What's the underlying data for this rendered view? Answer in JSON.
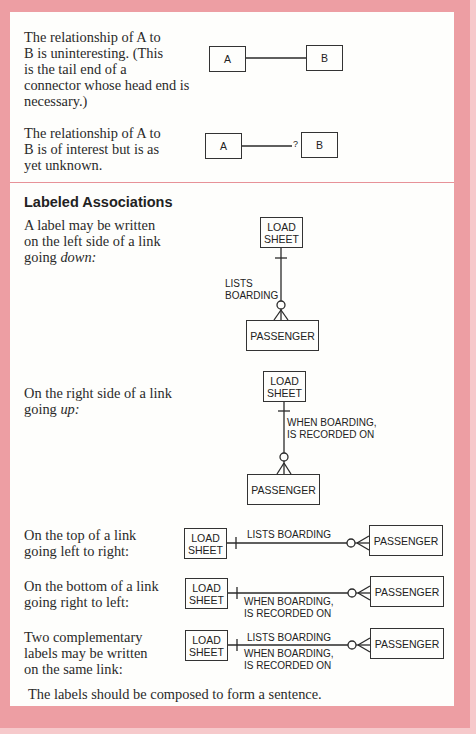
{
  "colors": {
    "border_pink": "#ed9ea3",
    "panel_bg": "#fefefc",
    "ink": "#2a2a2a"
  },
  "basic": {
    "uninteresting": {
      "text": "The relationship of A to\nB is uninteresting. (This\nis the tail end of a\nconnector whose head end is\nnecessary.)",
      "left_entity": "A",
      "right_entity": "B"
    },
    "unknown": {
      "text": "The relationship of A to\nB is of interest but is as\nyet unknown.",
      "left_entity": "A",
      "right_entity": "B",
      "marker": "?"
    }
  },
  "labeled": {
    "heading": "Labeled Associations",
    "down": {
      "text_prefix": "A label may be written\non the left side of a link\ngoing ",
      "text_em": "down:",
      "top_entity": "LOAD\nSHEET",
      "bottom_entity": "PASSENGER",
      "label": "LISTS\nBOARDING"
    },
    "up": {
      "text_prefix": "On the right side of a link\ngoing ",
      "text_em": "up:",
      "top_entity": "LOAD\nSHEET",
      "bottom_entity": "PASSENGER",
      "label": "WHEN BOARDING,\nIS RECORDED ON"
    },
    "top_ltr": {
      "text": "On the top of a link\ngoing left to right:",
      "left_entity": "LOAD\nSHEET",
      "right_entity": "PASSENGER",
      "label_top": "LISTS BOARDING"
    },
    "bottom_rtl": {
      "text": "On the bottom of a link\ngoing right to left:",
      "left_entity": "LOAD\nSHEET",
      "right_entity": "PASSENGER",
      "label_bottom": "WHEN BOARDING,\nIS RECORDED ON"
    },
    "both": {
      "text": "Two complementary\nlabels may be written\non the same link:",
      "left_entity": "LOAD\nSHEET",
      "right_entity": "PASSENGER",
      "label_top": "LISTS BOARDING",
      "label_bottom": "WHEN BOARDING,\nIS RECORDED ON"
    },
    "footer": "The labels should be composed to form a sentence."
  }
}
